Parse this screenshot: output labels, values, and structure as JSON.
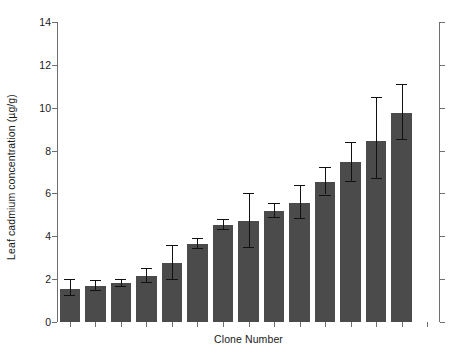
{
  "chart_data": {
    "type": "bar",
    "title": "",
    "xlabel": "Clone Number",
    "ylabel": "Leaf cadmium concentration (µg/g)",
    "ylim": [
      0,
      14
    ],
    "yticks": [
      0,
      2,
      4,
      6,
      8,
      10,
      12,
      14
    ],
    "ytick_labels": [
      "0",
      "2",
      "4",
      "6",
      "8",
      "10",
      "12",
      "14"
    ],
    "xtick_labels": [],
    "grid": false,
    "legend": null,
    "bar_color": "#4b4b4b",
    "error_bar_color": "#111111",
    "axis_color": "#6e6e6e",
    "categories": [
      "1",
      "2",
      "3",
      "4",
      "5",
      "6",
      "7",
      "8",
      "9",
      "10",
      "11",
      "12",
      "13",
      "14",
      "15"
    ],
    "values": [
      1.55,
      1.68,
      1.82,
      2.15,
      2.75,
      3.65,
      4.55,
      4.7,
      5.2,
      5.55,
      6.55,
      7.45,
      8.45,
      9.75,
      0
    ],
    "errors_upper": [
      0.45,
      0.3,
      0.2,
      0.35,
      0.85,
      0.25,
      0.25,
      1.3,
      0.35,
      0.85,
      0.7,
      0.95,
      2.05,
      1.35,
      0
    ],
    "errors_lower": [
      0.3,
      0.2,
      0.15,
      0.3,
      0.75,
      0.2,
      0.2,
      1.2,
      0.3,
      0.7,
      0.6,
      0.85,
      1.75,
      1.2,
      0
    ],
    "n_bars": 15
  },
  "axis": {
    "xlabel": "Clone Number",
    "ylabel": "Leaf cadmium concentration (µg/g)"
  }
}
